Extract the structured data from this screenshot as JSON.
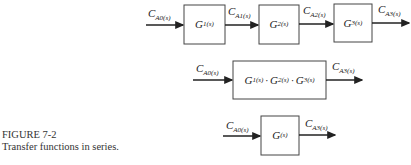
{
  "caption": {
    "figure": "FIGURE 7-2",
    "text": "Transfer functions in series."
  },
  "row1": {
    "blocks": [
      {
        "symbol": "G",
        "sub": "1(s)"
      },
      {
        "symbol": "G",
        "sub": "2(s)"
      },
      {
        "symbol": "G",
        "sub": "3(s)"
      }
    ],
    "signals": [
      {
        "symbol": "C",
        "sub": "A0(s)"
      },
      {
        "symbol": "C",
        "sub": "A1(s)"
      },
      {
        "symbol": "C",
        "sub": "A2(s)"
      },
      {
        "symbol": "C",
        "sub": "A3(s)"
      }
    ]
  },
  "row2": {
    "block": {
      "terms": [
        {
          "symbol": "G",
          "sub": "1(s)"
        },
        {
          "symbol": "G",
          "sub": "2(s)"
        },
        {
          "symbol": "G",
          "sub": "3(s)"
        }
      ],
      "separator": "·"
    },
    "signals": [
      {
        "symbol": "C",
        "sub": "A0(s)"
      },
      {
        "symbol": "C",
        "sub": "A3(s)"
      }
    ]
  },
  "row3": {
    "block": {
      "symbol": "G",
      "sub": "(s)"
    },
    "signals": [
      {
        "symbol": "C",
        "sub": "A0(s)"
      },
      {
        "symbol": "C",
        "sub": "A3(s)"
      }
    ]
  }
}
